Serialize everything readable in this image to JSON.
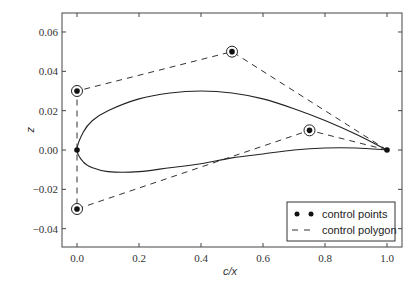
{
  "chart_data": {
    "type": "line",
    "title": "",
    "xlabel": "c/x",
    "ylabel": "z",
    "xlim": [
      -0.05,
      1.05
    ],
    "ylim": [
      -0.05,
      0.07
    ],
    "xticks": [
      "0.0",
      "0.2",
      "0.4",
      "0.6",
      "0.8",
      "1.0"
    ],
    "yticks": [
      "0.06",
      "0.04",
      "0.02",
      "0.00",
      "−0.02",
      "−0.04"
    ],
    "grid": false,
    "legend_position": "lower right",
    "legend": [
      {
        "label": "control points",
        "marker": "dot"
      },
      {
        "label": "control polygon",
        "style": "dashed"
      }
    ],
    "series": [
      {
        "name": "airfoil",
        "style": "solid",
        "x": [
          1.0,
          0.9,
          0.8,
          0.7,
          0.6,
          0.5,
          0.4,
          0.3,
          0.2,
          0.1,
          0.05,
          0.02,
          0.0,
          0.02,
          0.05,
          0.1,
          0.2,
          0.3,
          0.4,
          0.5,
          0.6,
          0.7,
          0.8,
          0.9,
          1.0
        ],
        "y": [
          0.0,
          0.008,
          0.015,
          0.021,
          0.026,
          0.029,
          0.03,
          0.029,
          0.026,
          0.02,
          0.015,
          0.009,
          0.0,
          -0.006,
          -0.009,
          -0.011,
          -0.011,
          -0.009,
          -0.007,
          -0.004,
          -0.002,
          0.0,
          0.001,
          0.001,
          0.0
        ]
      },
      {
        "name": "control polygon",
        "style": "dashed",
        "x": [
          1.0,
          0.5,
          0.0,
          0.0,
          0.0,
          0.75,
          1.0
        ],
        "y": [
          0.0,
          0.05,
          0.03,
          0.0,
          -0.03,
          0.01,
          0.0
        ]
      }
    ],
    "control_points": [
      {
        "x": 0.0,
        "y": 0.03,
        "circled": true
      },
      {
        "x": 0.5,
        "y": 0.05,
        "circled": true
      },
      {
        "x": 0.75,
        "y": 0.01,
        "circled": true
      },
      {
        "x": 0.0,
        "y": -0.03,
        "circled": true
      },
      {
        "x": 0.0,
        "y": 0.0,
        "circled": false
      },
      {
        "x": 1.0,
        "y": 0.0,
        "circled": false
      }
    ]
  }
}
